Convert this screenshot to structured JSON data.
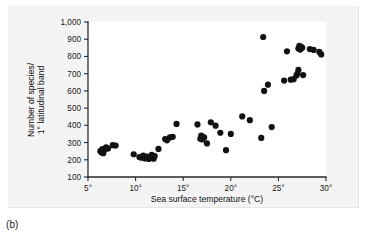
{
  "caption": "(b)",
  "chart_data": {
    "type": "scatter",
    "title": "",
    "xlabel": "Sea surface temperature (°C)",
    "ylabel": "Number of species/\n1° latitudinal band",
    "ylabel_line1": "Number of species/",
    "ylabel_line2": "1° latitudinal band",
    "xlim": [
      5,
      30
    ],
    "ylim": [
      100,
      1000
    ],
    "xticks": [
      5,
      10,
      15,
      20,
      25,
      30
    ],
    "xtick_labels": [
      "5°",
      "10°",
      "15°",
      "20°",
      "25°",
      "30°"
    ],
    "yticks": [
      100,
      200,
      300,
      400,
      500,
      600,
      700,
      800,
      900,
      1000
    ],
    "ytick_labels": [
      "100",
      "200",
      "300",
      "400",
      "500",
      "600",
      "700",
      "800",
      "900",
      "1,000"
    ],
    "grid": false,
    "legend": false,
    "marker_color": "#121212",
    "marker_size": 3.1,
    "axis_color": "#2b2b2b",
    "background_color": "#ffffff",
    "panel_color": "#f4f4f4",
    "points": [
      [
        6.3,
        250
      ],
      [
        6.4,
        243
      ],
      [
        6.5,
        262
      ],
      [
        6.6,
        238
      ],
      [
        6.7,
        256
      ],
      [
        6.9,
        272
      ],
      [
        7.1,
        265
      ],
      [
        7.6,
        285
      ],
      [
        7.9,
        283
      ],
      [
        9.8,
        232
      ],
      [
        10.4,
        216
      ],
      [
        10.6,
        212
      ],
      [
        10.8,
        224
      ],
      [
        11.0,
        208
      ],
      [
        11.2,
        218
      ],
      [
        11.4,
        205
      ],
      [
        11.6,
        213
      ],
      [
        11.7,
        228
      ],
      [
        11.9,
        206
      ],
      [
        12.0,
        222
      ],
      [
        12.4,
        263
      ],
      [
        13.1,
        320
      ],
      [
        13.3,
        313
      ],
      [
        13.6,
        330
      ],
      [
        13.9,
        333
      ],
      [
        14.3,
        408
      ],
      [
        16.5,
        405
      ],
      [
        16.8,
        322
      ],
      [
        16.9,
        340
      ],
      [
        17.0,
        318
      ],
      [
        17.2,
        330
      ],
      [
        17.5,
        295
      ],
      [
        17.9,
        418
      ],
      [
        18.4,
        398
      ],
      [
        18.9,
        357
      ],
      [
        19.5,
        256
      ],
      [
        20.0,
        350
      ],
      [
        21.2,
        452
      ],
      [
        22.0,
        430
      ],
      [
        23.2,
        327
      ],
      [
        23.4,
        913
      ],
      [
        23.5,
        600
      ],
      [
        23.9,
        636
      ],
      [
        24.3,
        390
      ],
      [
        25.6,
        660
      ],
      [
        25.9,
        830
      ],
      [
        26.3,
        665
      ],
      [
        26.6,
        668
      ],
      [
        26.9,
        690
      ],
      [
        27.0,
        700
      ],
      [
        27.1,
        722
      ],
      [
        27.1,
        846
      ],
      [
        27.2,
        862
      ],
      [
        27.3,
        840
      ],
      [
        27.4,
        855
      ],
      [
        27.5,
        850
      ],
      [
        27.6,
        692
      ],
      [
        28.3,
        843
      ],
      [
        28.7,
        838
      ],
      [
        29.3,
        826
      ],
      [
        29.5,
        812
      ]
    ]
  }
}
